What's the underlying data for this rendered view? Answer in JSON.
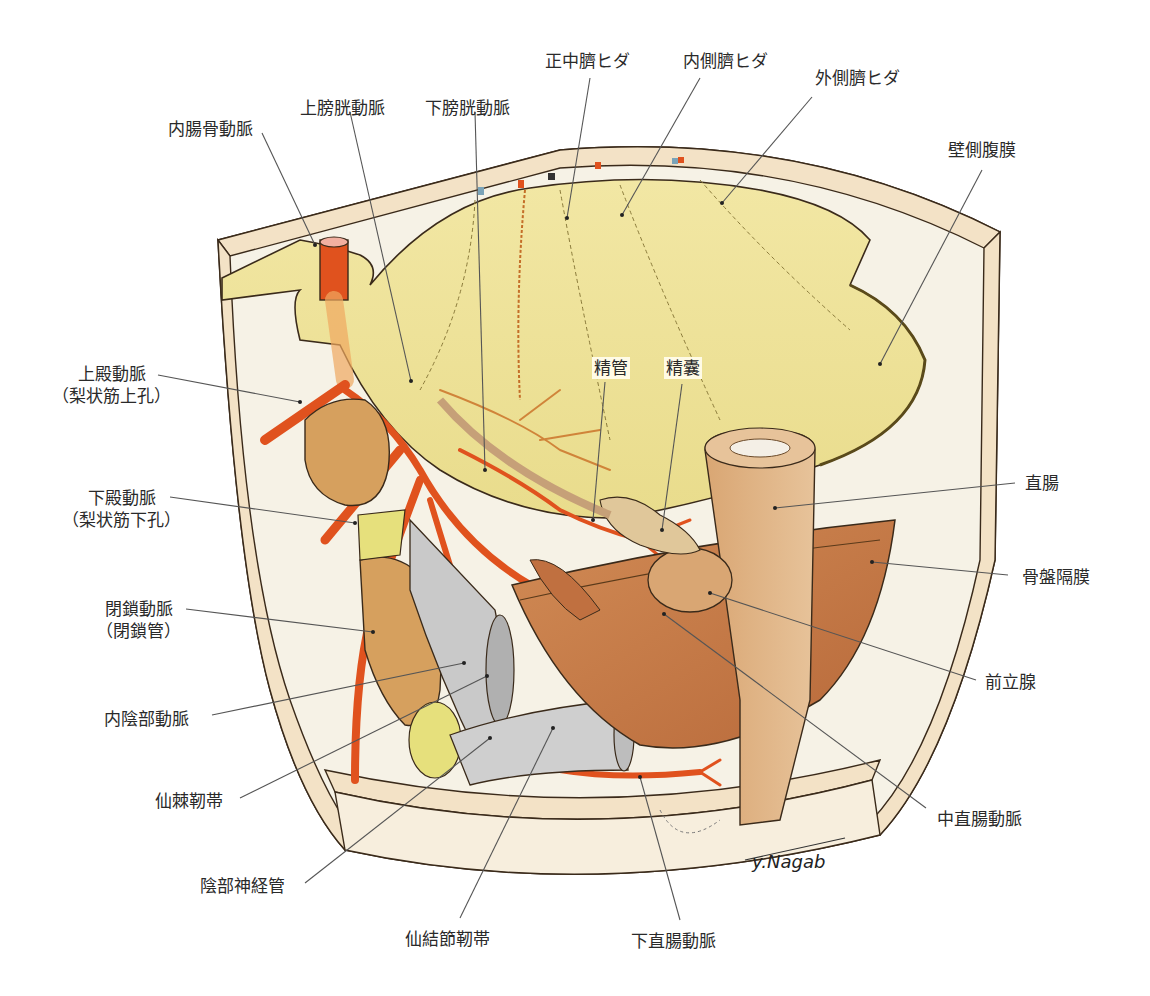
{
  "figure": {
    "type": "anatomical illustration",
    "signature": "y.Nagab",
    "colors": {
      "peritoneum": "#efe49a",
      "artery": "#e0521e",
      "muscle": "#c8814a",
      "ligament": "#c9c9c9",
      "frame": "#f3e2c6",
      "box_interior": "#f6f2e6",
      "rectum": "#d9a977",
      "bone": "#e6e07c"
    }
  },
  "labels": [
    {
      "id": "internal-iliac-artery",
      "text": "内腸骨動脈",
      "x": 168,
      "y": 118,
      "anchor": [
        315,
        245
      ],
      "from": [
        262,
        133
      ]
    },
    {
      "id": "superior-vesical-artery",
      "text": "上膀胱動脈",
      "x": 300,
      "y": 97,
      "anchor": [
        411,
        381
      ],
      "from": [
        350,
        112
      ]
    },
    {
      "id": "inferior-vesical-artery",
      "text": "下膀胱動脈",
      "x": 425,
      "y": 97,
      "anchor": [
        485,
        470
      ],
      "from": [
        475,
        112
      ]
    },
    {
      "id": "median-umbilical-fold",
      "text": "正中臍ヒダ",
      "x": 545,
      "y": 50,
      "anchor": [
        567,
        218
      ],
      "from": [
        590,
        78
      ]
    },
    {
      "id": "medial-umbilical-fold",
      "text": "内側臍ヒダ",
      "x": 683,
      "y": 50,
      "anchor": [
        622,
        215
      ],
      "from": [
        700,
        78
      ]
    },
    {
      "id": "lateral-umbilical-fold",
      "text": "外側臍ヒダ",
      "x": 815,
      "y": 67,
      "anchor": [
        722,
        203
      ],
      "from": [
        812,
        97
      ]
    },
    {
      "id": "parietal-peritoneum",
      "text": "壁側腹膜",
      "x": 948,
      "y": 139,
      "anchor": [
        880,
        364
      ],
      "from": [
        982,
        170
      ]
    },
    {
      "id": "superior-gluteal-artery",
      "text": "上殿動脈",
      "sub": "（梨状筋上孔）",
      "x": 52,
      "y": 363,
      "anchor": [
        300,
        402
      ],
      "from": [
        158,
        375
      ]
    },
    {
      "id": "inferior-gluteal-artery",
      "text": "下殿動脈",
      "sub": "（梨状筋下孔）",
      "x": 62,
      "y": 487,
      "anchor": [
        355,
        523
      ],
      "from": [
        170,
        497
      ]
    },
    {
      "id": "obturator-artery",
      "text": "閉鎖動脈",
      "sub": "（閉鎖管）",
      "x": 96,
      "y": 598,
      "anchor": [
        373,
        632
      ],
      "from": [
        186,
        609
      ]
    },
    {
      "id": "internal-pudendal-artery",
      "text": "内陰部動脈",
      "x": 104,
      "y": 708,
      "anchor": [
        464,
        663
      ],
      "from": [
        212,
        715
      ]
    },
    {
      "id": "sacrospinous-ligament",
      "text": "仙棘靭帯",
      "x": 155,
      "y": 790,
      "anchor": [
        487,
        676
      ],
      "from": [
        240,
        798
      ]
    },
    {
      "id": "pudendal-canal",
      "text": "陰部神経管",
      "x": 200,
      "y": 875,
      "anchor": [
        490,
        738
      ],
      "from": [
        305,
        883
      ]
    },
    {
      "id": "sacrotuberous-ligament",
      "text": "仙結節靭帯",
      "x": 405,
      "y": 928,
      "anchor": [
        553,
        728
      ],
      "from": [
        460,
        918
      ]
    },
    {
      "id": "inferior-rectal-artery",
      "text": "下直腸動脈",
      "x": 631,
      "y": 930,
      "anchor": [
        640,
        777
      ],
      "from": [
        680,
        920
      ]
    },
    {
      "id": "middle-rectal-artery",
      "text": "中直腸動脈",
      "x": 937,
      "y": 808,
      "anchor": [
        664,
        614
      ],
      "from": [
        926,
        808
      ]
    },
    {
      "id": "prostate",
      "text": "前立腺",
      "x": 985,
      "y": 671,
      "anchor": [
        710,
        593
      ],
      "from": [
        976,
        680
      ]
    },
    {
      "id": "levator-ani",
      "text": "骨盤隔膜",
      "x": 1022,
      "y": 566,
      "anchor": [
        872,
        562
      ],
      "from": [
        1008,
        575
      ]
    },
    {
      "id": "rectum",
      "text": "直腸",
      "x": 1025,
      "y": 472,
      "anchor": [
        775,
        508
      ],
      "from": [
        1015,
        483
      ]
    },
    {
      "id": "vas-deferens",
      "text": "精管",
      "x": 592,
      "y": 357,
      "anchor": [
        593,
        520
      ],
      "from": [
        605,
        382
      ],
      "inbox": true
    },
    {
      "id": "seminal-vesicle",
      "text": "精囊",
      "x": 664,
      "y": 357,
      "anchor": [
        662,
        530
      ],
      "from": [
        682,
        384
      ],
      "inbox": true
    }
  ]
}
